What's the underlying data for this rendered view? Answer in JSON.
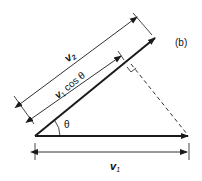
{
  "diagram": {
    "panel_label": "(b)",
    "labels": {
      "v2": "v",
      "v2_sub": "2",
      "v1cos": "v",
      "v1cos_sub": "1",
      "cos_theta": " cos θ",
      "theta": "θ",
      "v1": "v",
      "v1_sub": "1"
    },
    "colors": {
      "stroke": "#1a1a1a",
      "background": "#ffffff"
    }
  }
}
